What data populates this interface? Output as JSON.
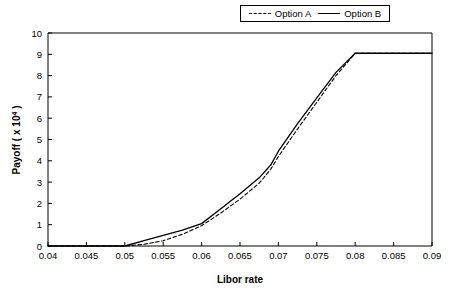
{
  "chart_data": {
    "type": "line",
    "title": "",
    "xlabel": "Libor rate",
    "ylabel": "Payoff ( x 10⁴ )",
    "ylabel_base": "Payoff ( x 10",
    "ylabel_exponent": "4",
    "ylabel_suffix": " )",
    "xlim": [
      0.04,
      0.09
    ],
    "ylim": [
      0,
      10
    ],
    "xticks": [
      0.04,
      0.045,
      0.05,
      0.055,
      0.06,
      0.065,
      0.07,
      0.075,
      0.08,
      0.085,
      0.09
    ],
    "xtick_labels": [
      "0.04",
      "0.045",
      "0.05",
      "0.055",
      "0.06",
      "0.065",
      "0.07",
      "0.075",
      "0.08",
      "0.085",
      "0.09"
    ],
    "yticks": [
      0,
      1,
      2,
      3,
      4,
      5,
      6,
      7,
      8,
      9,
      10
    ],
    "ytick_labels": [
      "0",
      "1",
      "2",
      "3",
      "4",
      "5",
      "6",
      "7",
      "8",
      "9",
      "10"
    ],
    "grid": false,
    "legend_position": "top-right",
    "series": [
      {
        "name": "Option A",
        "style": "dashed",
        "color": "#000000",
        "x": [
          0.04,
          0.05,
          0.0525,
          0.055,
          0.0575,
          0.06,
          0.0625,
          0.065,
          0.0675,
          0.069,
          0.07,
          0.0725,
          0.075,
          0.0775,
          0.08,
          0.085,
          0.09
        ],
        "y": [
          0.0,
          0.0,
          0.08,
          0.25,
          0.55,
          0.95,
          1.55,
          2.2,
          2.95,
          3.6,
          4.2,
          5.5,
          6.75,
          8.0,
          9.05,
          9.05,
          9.05
        ]
      },
      {
        "name": "Option B",
        "style": "solid",
        "color": "#000000",
        "x": [
          0.04,
          0.05,
          0.0525,
          0.055,
          0.0575,
          0.06,
          0.0625,
          0.065,
          0.0675,
          0.069,
          0.07,
          0.0725,
          0.075,
          0.0775,
          0.08,
          0.085,
          0.09
        ],
        "y": [
          0.0,
          0.0,
          0.25,
          0.5,
          0.75,
          1.05,
          1.75,
          2.45,
          3.2,
          3.8,
          4.45,
          5.75,
          6.95,
          8.15,
          9.05,
          9.05,
          9.05
        ]
      }
    ],
    "annotations": []
  },
  "legend": {
    "entries": [
      {
        "label": "Option A"
      },
      {
        "label": "Option B"
      }
    ]
  }
}
